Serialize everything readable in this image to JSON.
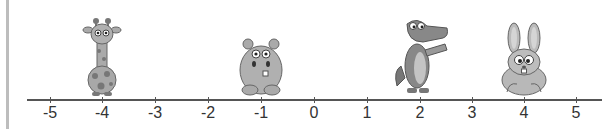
{
  "number_line": {
    "min": -5,
    "max": 5,
    "ticks": [
      {
        "value": -5,
        "label": "-5",
        "x": 50
      },
      {
        "value": -4,
        "label": "-4",
        "x": 102
      },
      {
        "value": -3,
        "label": "-3",
        "x": 155
      },
      {
        "value": -2,
        "label": "-2",
        "x": 208
      },
      {
        "value": -1,
        "label": "-1",
        "x": 261
      },
      {
        "value": 0,
        "label": "0",
        "x": 314
      },
      {
        "value": 1,
        "label": "1",
        "x": 367
      },
      {
        "value": 2,
        "label": "2",
        "x": 420
      },
      {
        "value": 3,
        "label": "3",
        "x": 472
      },
      {
        "value": 4,
        "label": "4",
        "x": 524
      },
      {
        "value": 5,
        "label": "5",
        "x": 576
      }
    ]
  },
  "animals": [
    {
      "name": "giraffe",
      "position": -4
    },
    {
      "name": "hippo",
      "position": -1
    },
    {
      "name": "crocodile",
      "position": 2
    },
    {
      "name": "rabbit",
      "position": 4
    }
  ]
}
